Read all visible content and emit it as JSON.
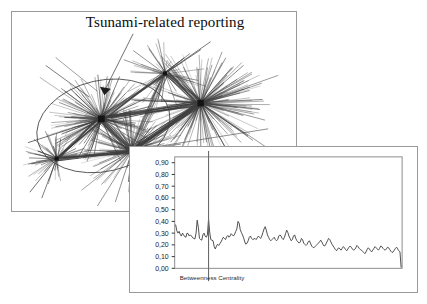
{
  "figure": {
    "background_color": "#ffffff",
    "panel_border_color": "#9a9a9a"
  },
  "network_panel": {
    "name": "network-figure-panel",
    "title": "Tsunami-related reporting",
    "annotation": {
      "leader_line": "pointer-from-title-to-cluster",
      "arrowhead": "arrow-down-left"
    },
    "overlay": {
      "shape": "ellipse",
      "description": "ellipse-encircling-left-cluster"
    },
    "graph": {
      "type": "node-link-hairball",
      "edge_color": "#4a4a4a",
      "node_color": "#1c1c1c",
      "hub_count": 5
    }
  },
  "chart_panel": {
    "name": "chart-figure-panel"
  },
  "chart_data": {
    "type": "line",
    "title": "",
    "xlabel": "Betweenness Centrality",
    "ylabel": "",
    "ylim": [
      0.0,
      0.95
    ],
    "yticks": [
      0.0,
      0.1,
      0.2,
      0.3,
      0.4,
      0.5,
      0.6,
      0.7,
      0.8,
      0.9
    ],
    "ytick_labels": [
      "0,00",
      "0,10",
      "0,20",
      "0,30",
      "0,40",
      "0,50",
      "0,60",
      "0,70",
      "0,80",
      "0,90"
    ],
    "xticks": [],
    "xtick_labels": [],
    "grid": false,
    "legend": null,
    "line_color": "#3b3b3b",
    "marker_line": {
      "name": "betweenness-centrality-marker",
      "x_index": 29,
      "color": "#6a6a6a"
    },
    "series": [
      {
        "name": "betweenness centrality",
        "values": [
          0.37,
          0.32,
          0.3,
          0.315,
          0.29,
          0.275,
          0.3,
          0.285,
          0.27,
          0.265,
          0.3,
          0.295,
          0.275,
          0.285,
          0.275,
          0.26,
          0.255,
          0.25,
          0.3,
          0.41,
          0.35,
          0.255,
          0.245,
          0.24,
          0.285,
          0.3,
          0.275,
          0.265,
          0.285,
          0.42,
          0.31,
          0.245,
          0.24,
          0.235,
          0.185,
          0.165,
          0.19,
          0.205,
          0.195,
          0.21,
          0.225,
          0.245,
          0.265,
          0.255,
          0.245,
          0.27,
          0.28,
          0.265,
          0.275,
          0.295,
          0.285,
          0.275,
          0.29,
          0.315,
          0.335,
          0.4,
          0.385,
          0.33,
          0.305,
          0.285,
          0.26,
          0.225,
          0.205,
          0.215,
          0.235,
          0.265,
          0.275,
          0.255,
          0.245,
          0.25,
          0.255,
          0.245,
          0.26,
          0.275,
          0.265,
          0.255,
          0.275,
          0.305,
          0.335,
          0.355,
          0.325,
          0.285,
          0.265,
          0.245,
          0.235,
          0.245,
          0.255,
          0.265,
          0.245,
          0.235,
          0.245,
          0.275,
          0.285,
          0.275,
          0.255,
          0.245,
          0.265,
          0.295,
          0.325,
          0.305,
          0.275,
          0.255,
          0.235,
          0.245,
          0.275,
          0.285,
          0.255,
          0.235,
          0.225,
          0.215,
          0.225,
          0.255,
          0.245,
          0.215,
          0.205,
          0.195,
          0.205,
          0.225,
          0.235,
          0.215,
          0.19,
          0.18,
          0.175,
          0.185,
          0.195,
          0.205,
          0.215,
          0.225,
          0.24,
          0.225,
          0.205,
          0.19,
          0.195,
          0.215,
          0.235,
          0.255,
          0.245,
          0.225,
          0.205,
          0.19,
          0.175,
          0.16,
          0.15,
          0.165,
          0.175,
          0.165,
          0.155,
          0.17,
          0.185,
          0.175,
          0.16,
          0.15,
          0.165,
          0.18,
          0.19,
          0.18,
          0.165,
          0.155,
          0.16,
          0.175,
          0.195,
          0.185,
          0.17,
          0.16,
          0.155,
          0.145,
          0.135,
          0.125,
          0.14,
          0.16,
          0.175,
          0.165,
          0.15,
          0.14,
          0.155,
          0.17,
          0.185,
          0.175,
          0.165,
          0.155,
          0.17,
          0.19,
          0.185,
          0.17,
          0.16,
          0.155,
          0.165,
          0.18,
          0.175,
          0.16,
          0.145,
          0.135,
          0.14,
          0.155,
          0.17,
          0.18,
          0.165,
          0.15,
          0.14,
          0.01
        ]
      }
    ]
  }
}
